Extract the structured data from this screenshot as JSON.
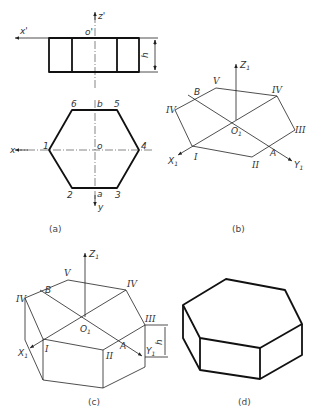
{
  "figure": {
    "panels": [
      {
        "id": "a",
        "caption": "(a)",
        "description": "Orthographic views of hexagonal prism: front view and top view"
      },
      {
        "id": "b",
        "caption": "(b)",
        "description": "Isometric axes with top hexagon constructed"
      },
      {
        "id": "c",
        "caption": "(c)",
        "description": "Isometric construction with height h projected down"
      },
      {
        "id": "d",
        "caption": "(d)",
        "description": "Finished isometric hexagonal prism"
      }
    ],
    "panel_a": {
      "front_view": {
        "axis_x": "x'",
        "axis_z": "z'",
        "origin": "o'",
        "dim": "h"
      },
      "top_view": {
        "axis_x": "x",
        "axis_y": "y",
        "center": "o",
        "vertices": [
          "1",
          "2",
          "3",
          "4",
          "5",
          "6"
        ],
        "point_a": "a",
        "point_b": "b"
      }
    },
    "panel_b": {
      "axes": {
        "x": "X",
        "y": "Y",
        "z": "Z",
        "origin": "O",
        "subscript": "1"
      },
      "vertices": [
        "I",
        "II",
        "III",
        "IV",
        "V",
        "IV"
      ],
      "points": [
        "A",
        "B"
      ]
    },
    "panel_c": {
      "axes": {
        "x": "X",
        "y": "Y",
        "z": "Z",
        "origin": "O",
        "subscript": "1"
      },
      "vertices": [
        "I",
        "II",
        "III",
        "IV",
        "V",
        "IV"
      ],
      "points": [
        "A",
        "B"
      ],
      "dim": "h"
    }
  }
}
